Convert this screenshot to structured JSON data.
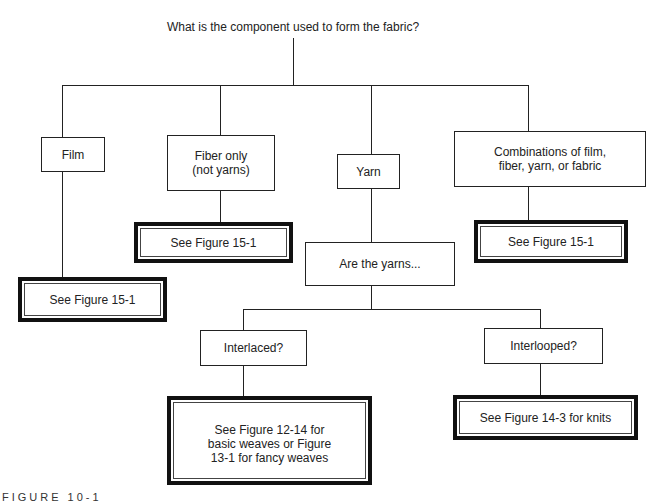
{
  "diagram": {
    "root_question": "What is the component used to form the fabric?",
    "level1": {
      "film": "Film",
      "fiber": "Fiber only\n(not yarns)",
      "yarn": "Yarn",
      "combinations": "Combinations of film,\nfiber, yarn, or fabric"
    },
    "refs": {
      "film": "See Figure 15-1",
      "fiber": "See Figure 15-1",
      "combinations": "See Figure 15-1"
    },
    "yarn_question": "Are the yarns...",
    "level2": {
      "interlaced": "Interlaced?",
      "interlooped": "Interlooped?"
    },
    "level2_refs": {
      "interlaced": "See Figure 12-14 for\nbasic weaves or Figure\n13-1 for fancy weaves",
      "interlooped": "See Figure 14-3 for knits"
    },
    "caption": "FIGURE 10-1"
  }
}
